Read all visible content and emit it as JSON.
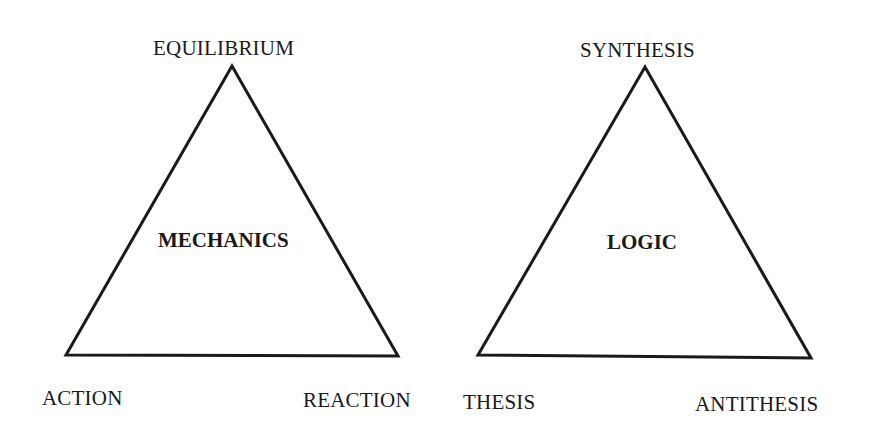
{
  "diagrams": [
    {
      "name": "mechanics",
      "center_label": "MECHANICS",
      "apex_label": "EQUILIBRIUM",
      "left_label": "ACTION",
      "right_label": "REACTION"
    },
    {
      "name": "logic",
      "center_label": "LOGIC",
      "apex_label": "SYNTHESIS",
      "left_label": "THESIS",
      "right_label": "ANTITHESIS"
    }
  ],
  "colors": {
    "stroke": "#1a1a1a",
    "background": "#ffffff"
  }
}
